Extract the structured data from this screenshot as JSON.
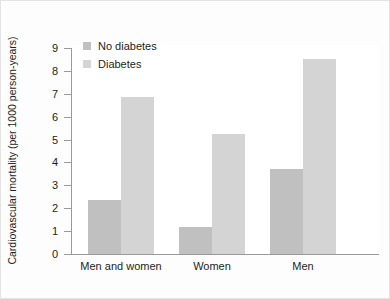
{
  "chart_data": {
    "type": "bar",
    "title": "",
    "subtitle": "",
    "xlabel": "",
    "ylabel": "Cardiovascular mortality (per 1000 person-years)",
    "categories": [
      "Men and women",
      "Women",
      "Men"
    ],
    "series": [
      {
        "name": "No diabetes",
        "color": "#c0c0c0",
        "values": [
          2.35,
          1.2,
          3.7
        ]
      },
      {
        "name": "Diabetes",
        "color": "#d4d4d4",
        "values": [
          6.85,
          5.25,
          8.5
        ]
      }
    ],
    "ylim": [
      0,
      9
    ],
    "yticks": [
      0,
      1,
      2,
      3,
      4,
      5,
      6,
      7,
      8,
      9
    ],
    "ytick_labels": [
      "0",
      "1",
      "2",
      "3",
      "4",
      "5",
      "6",
      "7",
      "8",
      "9"
    ],
    "grid": false,
    "legend_position": "top-left",
    "legend": [
      "No diabetes",
      "Diabetes"
    ]
  },
  "figure": {
    "background_color": "#fdfdfd",
    "plot_background_color": "#ffffff",
    "axis_color": "#9a9a9a",
    "text_color": "#231f20"
  }
}
